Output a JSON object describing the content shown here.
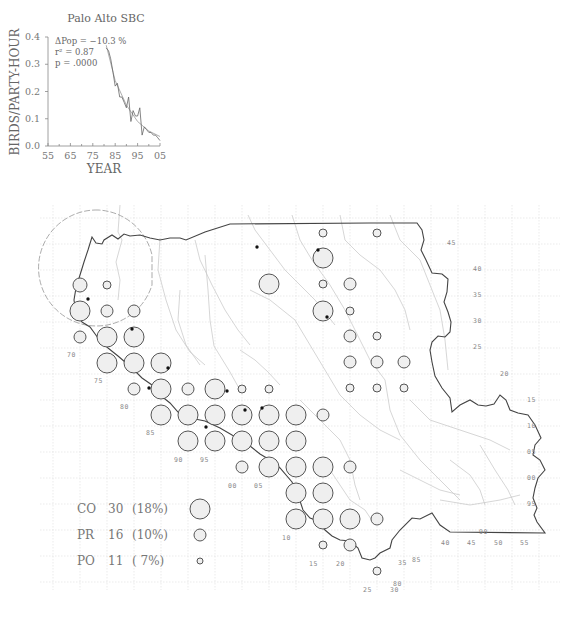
{
  "chart_data": {
    "type": "line",
    "title": "Palo Alto SBC",
    "xlabel": "YEAR",
    "ylabel": "BIRDS/PARTY-HOUR",
    "xlim": [
      1955,
      2005
    ],
    "ylim": [
      0.0,
      0.4
    ],
    "x_ticks": [
      "55",
      "65",
      "75",
      "85",
      "95",
      "05"
    ],
    "y_ticks": [
      "0.0",
      "0.1",
      "0.2",
      "0.3",
      "0.4"
    ],
    "grid": false,
    "annotations": {
      "dpop": "ΔPop = −10.3 %",
      "r2": "r² = 0.87",
      "p": "p = .0000"
    },
    "series": [
      {
        "name": "observed",
        "x": [
          1981,
          1982,
          1983,
          1984,
          1985,
          1986,
          1987,
          1988,
          1989,
          1990,
          1991,
          1992,
          1993,
          1994,
          1995,
          1996,
          1997,
          1998,
          1999,
          2000,
          2001,
          2002,
          2003,
          2004,
          2005
        ],
        "values": [
          0.36,
          0.35,
          0.32,
          0.27,
          0.22,
          0.23,
          0.18,
          0.18,
          0.16,
          0.14,
          0.18,
          0.09,
          0.13,
          0.11,
          0.11,
          0.14,
          0.04,
          0.07,
          0.06,
          0.05,
          0.05,
          0.04,
          0.04,
          0.03,
          0.02
        ]
      },
      {
        "name": "trend",
        "x": [
          1981,
          1985,
          1990,
          1995,
          2000,
          2005
        ],
        "values": [
          0.37,
          0.24,
          0.15,
          0.09,
          0.055,
          0.035
        ]
      }
    ]
  },
  "map": {
    "grid_labels_left": [
      "70",
      "75",
      "80",
      "85",
      "90",
      "95",
      "00",
      "05",
      "10",
      "15",
      "20",
      "25",
      "30"
    ],
    "grid_labels_right": [
      "45",
      "40",
      "35",
      "30",
      "25",
      "20",
      "15",
      "10",
      "05",
      "00",
      "95",
      "90",
      "85",
      "80"
    ],
    "grid_labels_bottom": [
      "40",
      "45",
      "50",
      "55",
      "35"
    ],
    "circles": [
      {
        "x": 80,
        "y": 285,
        "r": 7
      },
      {
        "x": 107,
        "y": 285,
        "r": 4
      },
      {
        "x": 80,
        "y": 311,
        "r": 10
      },
      {
        "x": 107,
        "y": 311,
        "r": 6
      },
      {
        "x": 134,
        "y": 311,
        "r": 6
      },
      {
        "x": 80,
        "y": 337,
        "r": 6
      },
      {
        "x": 107,
        "y": 337,
        "r": 10
      },
      {
        "x": 134,
        "y": 337,
        "r": 10
      },
      {
        "x": 107,
        "y": 363,
        "r": 10
      },
      {
        "x": 134,
        "y": 363,
        "r": 10
      },
      {
        "x": 161,
        "y": 363,
        "r": 10
      },
      {
        "x": 134,
        "y": 389,
        "r": 6
      },
      {
        "x": 161,
        "y": 389,
        "r": 10
      },
      {
        "x": 188,
        "y": 389,
        "r": 6
      },
      {
        "x": 215,
        "y": 389,
        "r": 10
      },
      {
        "x": 242,
        "y": 389,
        "r": 4
      },
      {
        "x": 269,
        "y": 389,
        "r": 4
      },
      {
        "x": 161,
        "y": 415,
        "r": 10
      },
      {
        "x": 188,
        "y": 415,
        "r": 10
      },
      {
        "x": 215,
        "y": 415,
        "r": 10
      },
      {
        "x": 242,
        "y": 415,
        "r": 10
      },
      {
        "x": 269,
        "y": 415,
        "r": 10
      },
      {
        "x": 296,
        "y": 415,
        "r": 10
      },
      {
        "x": 323,
        "y": 415,
        "r": 6
      },
      {
        "x": 188,
        "y": 441,
        "r": 10
      },
      {
        "x": 215,
        "y": 441,
        "r": 10
      },
      {
        "x": 242,
        "y": 441,
        "r": 10
      },
      {
        "x": 269,
        "y": 441,
        "r": 10
      },
      {
        "x": 296,
        "y": 441,
        "r": 10
      },
      {
        "x": 242,
        "y": 467,
        "r": 6
      },
      {
        "x": 269,
        "y": 467,
        "r": 10
      },
      {
        "x": 296,
        "y": 467,
        "r": 10
      },
      {
        "x": 323,
        "y": 467,
        "r": 10
      },
      {
        "x": 350,
        "y": 467,
        "r": 6
      },
      {
        "x": 296,
        "y": 493,
        "r": 10
      },
      {
        "x": 323,
        "y": 493,
        "r": 10
      },
      {
        "x": 296,
        "y": 519,
        "r": 10
      },
      {
        "x": 323,
        "y": 519,
        "r": 10
      },
      {
        "x": 350,
        "y": 519,
        "r": 10
      },
      {
        "x": 377,
        "y": 519,
        "r": 6
      },
      {
        "x": 323,
        "y": 545,
        "r": 4
      },
      {
        "x": 350,
        "y": 545,
        "r": 6
      },
      {
        "x": 377,
        "y": 571,
        "r": 4
      },
      {
        "x": 323,
        "y": 233,
        "r": 4
      },
      {
        "x": 377,
        "y": 233,
        "r": 4
      },
      {
        "x": 323,
        "y": 258,
        "r": 10
      },
      {
        "x": 269,
        "y": 284,
        "r": 10
      },
      {
        "x": 323,
        "y": 284,
        "r": 4
      },
      {
        "x": 350,
        "y": 284,
        "r": 6
      },
      {
        "x": 323,
        "y": 311,
        "r": 10
      },
      {
        "x": 350,
        "y": 311,
        "r": 4
      },
      {
        "x": 350,
        "y": 336,
        "r": 6
      },
      {
        "x": 377,
        "y": 336,
        "r": 4
      },
      {
        "x": 350,
        "y": 362,
        "r": 6
      },
      {
        "x": 377,
        "y": 362,
        "r": 6
      },
      {
        "x": 404,
        "y": 362,
        "r": 6
      },
      {
        "x": 350,
        "y": 388,
        "r": 4
      },
      {
        "x": 377,
        "y": 388,
        "r": 4
      },
      {
        "x": 404,
        "y": 388,
        "r": 4
      }
    ],
    "dots": [
      {
        "x": 88,
        "y": 299
      },
      {
        "x": 132,
        "y": 329
      },
      {
        "x": 168,
        "y": 368
      },
      {
        "x": 149,
        "y": 388
      },
      {
        "x": 227,
        "y": 391
      },
      {
        "x": 245,
        "y": 410
      },
      {
        "x": 262,
        "y": 408
      },
      {
        "x": 206,
        "y": 427
      },
      {
        "x": 257,
        "y": 247
      },
      {
        "x": 318,
        "y": 250
      },
      {
        "x": 327,
        "y": 317
      }
    ]
  },
  "legend": {
    "items": [
      {
        "code": "CO",
        "count": "30",
        "pct": "(18%)",
        "r": 10
      },
      {
        "code": "PR",
        "count": "16",
        "pct": "(10%)",
        "r": 6
      },
      {
        "code": "PO",
        "count": "11",
        "pct": "( 7%)",
        "r": 3
      }
    ]
  }
}
